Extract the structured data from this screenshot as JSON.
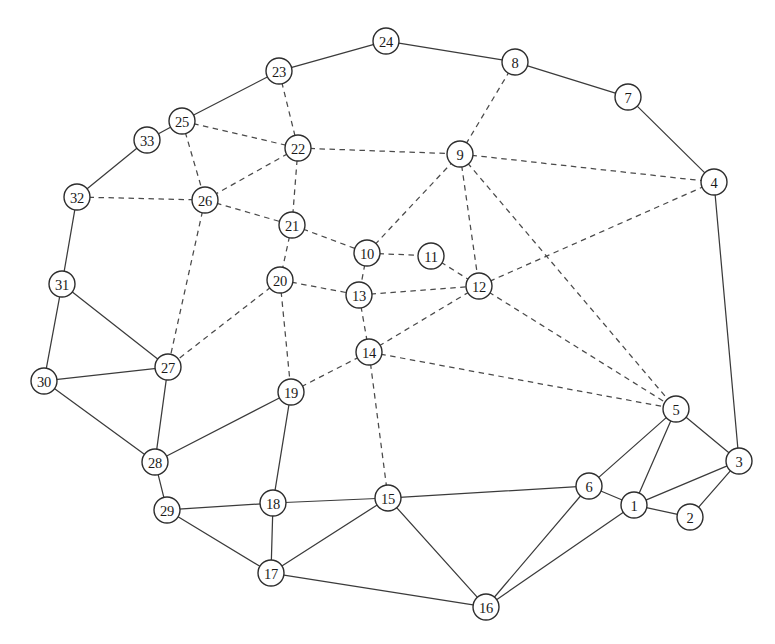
{
  "figure": {
    "type": "node-link-graph",
    "width": 775,
    "height": 644,
    "background_color": "#ffffff",
    "node_fill_color": "#ffffff",
    "node_stroke_color": "#2e2e2e",
    "edge_solid_color": "#3b3b3b",
    "edge_dashed_color": "#4a4a4a",
    "node_radius": 13
  },
  "graph_data": {
    "type": "graph",
    "node_count": 33,
    "edge_count": 69,
    "edge_styles": [
      "solid",
      "dashed"
    ],
    "nodes": [
      {
        "id": 1,
        "label": "1",
        "x": 634,
        "y": 505
      },
      {
        "id": 2,
        "label": "2",
        "x": 690,
        "y": 517
      },
      {
        "id": 3,
        "label": "3",
        "x": 739,
        "y": 461
      },
      {
        "id": 4,
        "label": "4",
        "x": 714,
        "y": 182
      },
      {
        "id": 5,
        "label": "5",
        "x": 676,
        "y": 409
      },
      {
        "id": 6,
        "label": "6",
        "x": 589,
        "y": 486
      },
      {
        "id": 7,
        "label": "7",
        "x": 628,
        "y": 97
      },
      {
        "id": 8,
        "label": "8",
        "x": 515,
        "y": 62
      },
      {
        "id": 9,
        "label": "9",
        "x": 460,
        "y": 154
      },
      {
        "id": 10,
        "label": "10",
        "x": 367,
        "y": 253
      },
      {
        "id": 11,
        "label": "11",
        "x": 431,
        "y": 256
      },
      {
        "id": 12,
        "label": "12",
        "x": 479,
        "y": 286
      },
      {
        "id": 13,
        "label": "13",
        "x": 359,
        "y": 295
      },
      {
        "id": 14,
        "label": "14",
        "x": 369,
        "y": 352
      },
      {
        "id": 15,
        "label": "15",
        "x": 388,
        "y": 498
      },
      {
        "id": 16,
        "label": "16",
        "x": 486,
        "y": 607
      },
      {
        "id": 17,
        "label": "17",
        "x": 271,
        "y": 573
      },
      {
        "id": 18,
        "label": "18",
        "x": 273,
        "y": 503
      },
      {
        "id": 19,
        "label": "19",
        "x": 291,
        "y": 392
      },
      {
        "id": 20,
        "label": "20",
        "x": 280,
        "y": 280
      },
      {
        "id": 21,
        "label": "21",
        "x": 292,
        "y": 225
      },
      {
        "id": 22,
        "label": "22",
        "x": 298,
        "y": 148
      },
      {
        "id": 23,
        "label": "23",
        "x": 279,
        "y": 71
      },
      {
        "id": 24,
        "label": "24",
        "x": 386,
        "y": 41
      },
      {
        "id": 25,
        "label": "25",
        "x": 182,
        "y": 121
      },
      {
        "id": 26,
        "label": "26",
        "x": 205,
        "y": 200
      },
      {
        "id": 27,
        "label": "27",
        "x": 168,
        "y": 367
      },
      {
        "id": 28,
        "label": "28",
        "x": 155,
        "y": 462
      },
      {
        "id": 29,
        "label": "29",
        "x": 167,
        "y": 510
      },
      {
        "id": 30,
        "label": "30",
        "x": 44,
        "y": 381
      },
      {
        "id": 31,
        "label": "31",
        "x": 62,
        "y": 284
      },
      {
        "id": 32,
        "label": "32",
        "x": 77,
        "y": 197
      },
      {
        "id": 33,
        "label": "33",
        "x": 147,
        "y": 140
      }
    ],
    "edges": [
      {
        "source": 24,
        "target": 23,
        "style": "solid"
      },
      {
        "source": 24,
        "target": 8,
        "style": "solid"
      },
      {
        "source": 8,
        "target": 7,
        "style": "solid"
      },
      {
        "source": 7,
        "target": 4,
        "style": "solid"
      },
      {
        "source": 4,
        "target": 3,
        "style": "solid"
      },
      {
        "source": 23,
        "target": 25,
        "style": "solid"
      },
      {
        "source": 25,
        "target": 33,
        "style": "solid"
      },
      {
        "source": 33,
        "target": 32,
        "style": "solid"
      },
      {
        "source": 32,
        "target": 31,
        "style": "solid"
      },
      {
        "source": 31,
        "target": 30,
        "style": "solid"
      },
      {
        "source": 31,
        "target": 27,
        "style": "solid"
      },
      {
        "source": 30,
        "target": 27,
        "style": "solid"
      },
      {
        "source": 30,
        "target": 28,
        "style": "solid"
      },
      {
        "source": 27,
        "target": 28,
        "style": "solid"
      },
      {
        "source": 28,
        "target": 29,
        "style": "solid"
      },
      {
        "source": 28,
        "target": 19,
        "style": "solid"
      },
      {
        "source": 29,
        "target": 18,
        "style": "solid"
      },
      {
        "source": 29,
        "target": 17,
        "style": "solid"
      },
      {
        "source": 19,
        "target": 18,
        "style": "solid"
      },
      {
        "source": 18,
        "target": 17,
        "style": "solid"
      },
      {
        "source": 18,
        "target": 15,
        "style": "solid"
      },
      {
        "source": 17,
        "target": 15,
        "style": "solid"
      },
      {
        "source": 17,
        "target": 16,
        "style": "solid"
      },
      {
        "source": 15,
        "target": 16,
        "style": "solid"
      },
      {
        "source": 15,
        "target": 6,
        "style": "solid"
      },
      {
        "source": 16,
        "target": 6,
        "style": "solid"
      },
      {
        "source": 16,
        "target": 1,
        "style": "solid"
      },
      {
        "source": 6,
        "target": 1,
        "style": "solid"
      },
      {
        "source": 6,
        "target": 5,
        "style": "solid"
      },
      {
        "source": 1,
        "target": 5,
        "style": "solid"
      },
      {
        "source": 1,
        "target": 2,
        "style": "solid"
      },
      {
        "source": 1,
        "target": 3,
        "style": "solid"
      },
      {
        "source": 2,
        "target": 3,
        "style": "solid"
      },
      {
        "source": 5,
        "target": 3,
        "style": "solid"
      },
      {
        "source": 23,
        "target": 22,
        "style": "dashed"
      },
      {
        "source": 25,
        "target": 22,
        "style": "dashed"
      },
      {
        "source": 25,
        "target": 26,
        "style": "dashed"
      },
      {
        "source": 22,
        "target": 26,
        "style": "dashed"
      },
      {
        "source": 22,
        "target": 21,
        "style": "dashed"
      },
      {
        "source": 22,
        "target": 9,
        "style": "dashed"
      },
      {
        "source": 32,
        "target": 26,
        "style": "dashed"
      },
      {
        "source": 26,
        "target": 21,
        "style": "dashed"
      },
      {
        "source": 26,
        "target": 27,
        "style": "dashed"
      },
      {
        "source": 21,
        "target": 20,
        "style": "dashed"
      },
      {
        "source": 21,
        "target": 10,
        "style": "dashed"
      },
      {
        "source": 20,
        "target": 27,
        "style": "dashed"
      },
      {
        "source": 20,
        "target": 13,
        "style": "dashed"
      },
      {
        "source": 20,
        "target": 19,
        "style": "dashed"
      },
      {
        "source": 19,
        "target": 14,
        "style": "dashed"
      },
      {
        "source": 10,
        "target": 9,
        "style": "dashed"
      },
      {
        "source": 10,
        "target": 11,
        "style": "dashed"
      },
      {
        "source": 10,
        "target": 13,
        "style": "dashed"
      },
      {
        "source": 11,
        "target": 12,
        "style": "dashed"
      },
      {
        "source": 13,
        "target": 12,
        "style": "dashed"
      },
      {
        "source": 13,
        "target": 14,
        "style": "dashed"
      },
      {
        "source": 14,
        "target": 12,
        "style": "dashed"
      },
      {
        "source": 14,
        "target": 15,
        "style": "dashed"
      },
      {
        "source": 14,
        "target": 5,
        "style": "dashed"
      },
      {
        "source": 9,
        "target": 8,
        "style": "dashed"
      },
      {
        "source": 9,
        "target": 4,
        "style": "dashed"
      },
      {
        "source": 9,
        "target": 12,
        "style": "dashed"
      },
      {
        "source": 9,
        "target": 5,
        "style": "dashed"
      },
      {
        "source": 12,
        "target": 4,
        "style": "dashed"
      },
      {
        "source": 12,
        "target": 5,
        "style": "dashed"
      }
    ]
  }
}
